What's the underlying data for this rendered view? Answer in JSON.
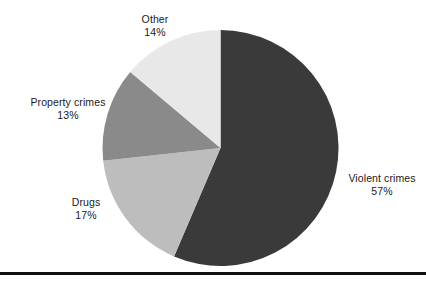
{
  "chart_data": {
    "type": "pie",
    "title": "",
    "subtitle": "",
    "xlabel": "",
    "ylabel": "",
    "legend_position": "none",
    "grid": false,
    "label_format": "name over percent",
    "start_angle_deg": 0,
    "direction": "clockwise",
    "units": "percent",
    "total": 101,
    "categories": [
      "Violent crimes",
      "Drugs",
      "Property crimes",
      "Other"
    ],
    "values": [
      57,
      17,
      13,
      14
    ],
    "slices": [
      {
        "name": "Violent crimes",
        "value": 57,
        "value_label": "57%",
        "color": "#3a3a3a",
        "start_deg": 0,
        "end_deg": 205.2,
        "label_position": "right"
      },
      {
        "name": "Drugs",
        "value": 17,
        "value_label": "17%",
        "color": "#bdbdbd",
        "start_deg": 205.2,
        "end_deg": 266.4,
        "label_position": "lower-left"
      },
      {
        "name": "Property crimes",
        "value": 13,
        "value_label": "13%",
        "color": "#8a8a8a",
        "start_deg": 266.4,
        "end_deg": 313.2,
        "label_position": "left"
      },
      {
        "name": "Other",
        "value": 14,
        "value_label": "14%",
        "color": "#e8e8e8",
        "start_deg": 313.2,
        "end_deg": 360,
        "label_position": "top"
      }
    ]
  },
  "figure": {
    "background_color": "#ffffff",
    "text_color": "#1a1a1a",
    "rule_color": "#111111",
    "center_x": 220.5,
    "center_y": 148,
    "radius": 118
  },
  "labels": {
    "other": {
      "name": "Other",
      "value": "14%"
    },
    "property_crimes": {
      "name": "Property crimes",
      "value": "13%"
    },
    "drugs": {
      "name": "Drugs",
      "value": "17%"
    },
    "violent_crimes": {
      "name": "Violent crimes",
      "value": "57%"
    }
  }
}
